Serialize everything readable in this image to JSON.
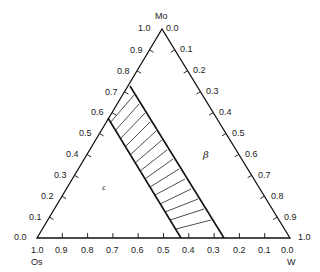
{
  "diagram": {
    "type": "ternary-phase-diagram",
    "vertices": {
      "top": {
        "label": "Mo",
        "value_left": "1.0",
        "value_right": "0.0"
      },
      "bottom_left": {
        "label": "Os",
        "value_bottom": "1.0",
        "value_left": "0.0"
      },
      "bottom_right": {
        "label": "W",
        "value_bottom": "0.0",
        "value_right": "1.0"
      }
    },
    "left_axis_ticks": [
      "0.1",
      "0.2",
      "0.3",
      "0.4",
      "0.5",
      "0.6",
      "0.7",
      "0.8",
      "0.9"
    ],
    "right_axis_ticks": [
      "0.1",
      "0.2",
      "0.3",
      "0.4",
      "0.5",
      "0.6",
      "0.7",
      "0.8",
      "0.9"
    ],
    "bottom_axis_ticks": [
      "0.9",
      "0.8",
      "0.7",
      "0.6",
      "0.5",
      "0.4",
      "0.3",
      "0.2",
      "0.1"
    ],
    "regions": [
      {
        "name": "epsilon",
        "label": "ε"
      },
      {
        "name": "beta",
        "label": "β"
      },
      {
        "name": "two-phase",
        "label": "",
        "style": "hatched tie-lines"
      }
    ]
  }
}
